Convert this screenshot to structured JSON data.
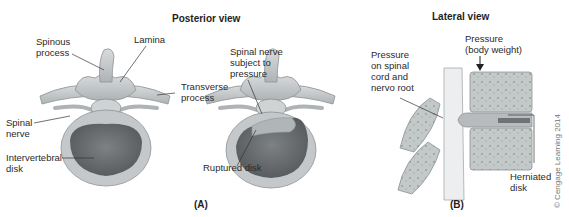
{
  "figure": {
    "panels": [
      {
        "id": "A",
        "tag": "(A)",
        "title": "Posterior view",
        "subfigures": [
          {
            "name": "normal-vertebra",
            "labels": {
              "spinous_process": "Spinous\nprocess",
              "lamina": "Lamina",
              "transverse_process": "Transverse\nprocess",
              "spinal_nerve": "Spinal\nnerve",
              "intervertebral_disk": "Intervertebral\ndisk"
            }
          },
          {
            "name": "ruptured-disk-vertebra",
            "labels": {
              "spinal_nerve_pressure": "Spinal nerve\nsubject to\npressure",
              "ruptured_disk": "Ruptured disk"
            }
          }
        ]
      },
      {
        "id": "B",
        "tag": "(B)",
        "title": "Lateral view",
        "labels": {
          "pressure_cord": "Pressure\non spinal\ncord and\nnervo root",
          "pressure_weight": "Pressure\n(body weight)",
          "herniated_disk": "Herniated\ndisk"
        }
      }
    ],
    "copyright": "© Cengage Learning 2014",
    "colors": {
      "bone": "#c9cdcf",
      "bone_dark": "#9ea4a7",
      "disk_outer": "#b8bcbe",
      "disk_inner": "#6f7376",
      "nerve": "#e8eaeb",
      "leader": "#333333"
    }
  }
}
